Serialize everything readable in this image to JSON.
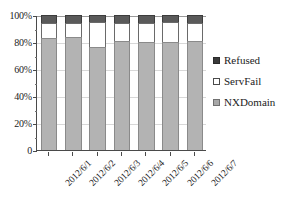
{
  "chart_data": {
    "type": "bar",
    "stacked": true,
    "normalized": "100%",
    "title": "",
    "subtitle": "",
    "xlabel": "",
    "ylabel": "",
    "categories": [
      "2012/6/1",
      "2012/6/2",
      "2012/6/3",
      "2012/6/4",
      "2012/6/5",
      "2012/6/6",
      "2012/6/7"
    ],
    "series": [
      {
        "name": "NXDomain",
        "color": "#b3b3b3",
        "values": [
          83,
          84,
          76,
          81,
          80,
          80,
          81
        ]
      },
      {
        "name": "ServFail",
        "color": "#ffffff",
        "values": [
          11,
          10,
          19,
          13,
          14,
          15,
          13
        ]
      },
      {
        "name": "Refused",
        "color": "#5a5a5a",
        "values": [
          6,
          6,
          5,
          6,
          6,
          5,
          6
        ]
      }
    ],
    "stack_order_bottom_to_top": [
      "NXDomain",
      "ServFail",
      "Refused"
    ],
    "ylim": [
      0,
      100
    ],
    "yticks": [
      0,
      20,
      40,
      60,
      80,
      100
    ],
    "ytick_labels": [
      "0",
      "20%",
      "40%",
      "60%",
      "80%",
      "100%"
    ],
    "grid": true,
    "legend_position": "right",
    "legend_order_top_to_bottom": [
      "Refused",
      "ServFail",
      "NXDomain"
    ]
  },
  "legend": {
    "items": [
      {
        "label": "Refused",
        "swatch": "refused-swatch-icon"
      },
      {
        "label": "ServFail",
        "swatch": "servfail-swatch-icon"
      },
      {
        "label": "NXDomain",
        "swatch": "nxdomain-swatch-icon"
      }
    ]
  }
}
